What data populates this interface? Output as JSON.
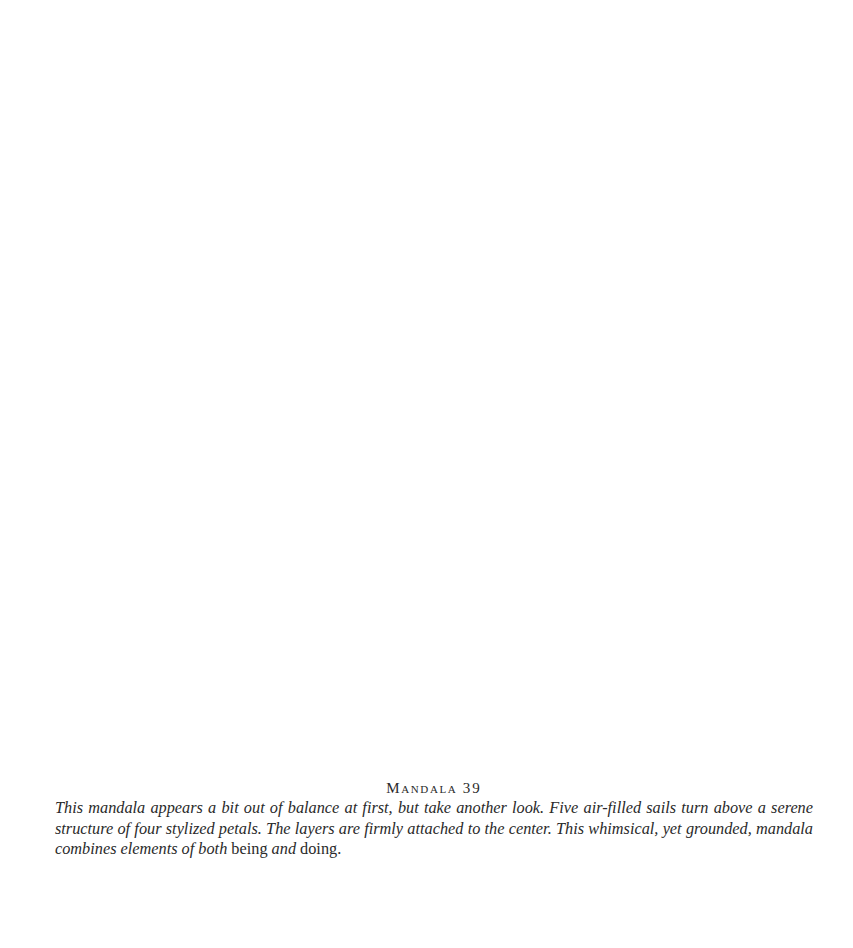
{
  "figure": {
    "title": "Mandala",
    "number": "39",
    "caption_segments": [
      {
        "text": "This mandala appears a bit out of balance at first, but take another look. Five air-filled sails turn above a serene structure of four stylized petals. The layers are firmly attached to the center. This whimsical, yet grounded, mandala combines elements of both",
        "style": "italic"
      },
      {
        "text": " being ",
        "style": "roman"
      },
      {
        "text": "and",
        "style": "italic"
      },
      {
        "text": " doing.",
        "style": "roman"
      }
    ]
  }
}
